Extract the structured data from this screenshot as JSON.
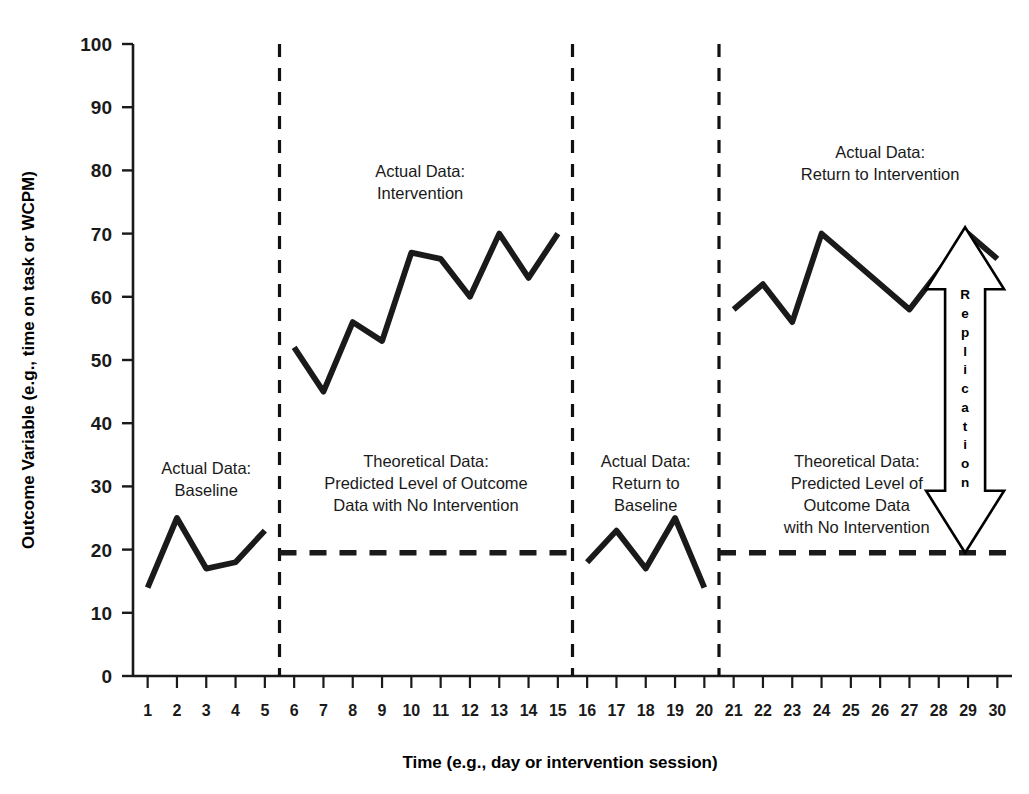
{
  "chart_data": {
    "type": "line",
    "title": "",
    "xlabel": "Time (e.g., day or intervention session)",
    "ylabel": "Outcome Variable (e.g., time on task or WCPM)",
    "xlim": [
      0.5,
      30.5
    ],
    "ylim": [
      0,
      100
    ],
    "yticks": [
      0,
      10,
      20,
      30,
      40,
      50,
      60,
      70,
      80,
      90,
      100
    ],
    "xticks": [
      1,
      2,
      3,
      4,
      5,
      6,
      7,
      8,
      9,
      10,
      11,
      12,
      13,
      14,
      15,
      16,
      17,
      18,
      19,
      20,
      21,
      22,
      23,
      24,
      25,
      26,
      27,
      28,
      29,
      30
    ],
    "grid": false,
    "legend": "none",
    "line_color": "#1a1a1a",
    "series": [
      {
        "name": "Baseline",
        "style": "solid",
        "x": [
          1,
          2,
          3,
          4,
          5
        ],
        "values": [
          14,
          25,
          17,
          18,
          23
        ]
      },
      {
        "name": "Intervention",
        "style": "solid",
        "x": [
          6,
          7,
          8,
          9,
          10,
          11,
          12,
          13,
          14,
          15
        ],
        "values": [
          52,
          45,
          56,
          53,
          67,
          66,
          60,
          70,
          63,
          70
        ]
      },
      {
        "name": "Return to Baseline",
        "style": "solid",
        "x": [
          16,
          17,
          18,
          19,
          20
        ],
        "values": [
          18,
          23,
          17,
          25,
          14
        ]
      },
      {
        "name": "Return to Intervention",
        "style": "solid",
        "x": [
          21,
          22,
          23,
          24,
          25,
          26,
          27,
          28,
          29,
          30
        ],
        "values": [
          58,
          62,
          56,
          70,
          66,
          62,
          58,
          64,
          70,
          66
        ]
      },
      {
        "name": "Theoretical Predicted Level 1",
        "style": "dashed",
        "x": [
          5.5,
          15.5
        ],
        "values": [
          19.5,
          19.5
        ]
      },
      {
        "name": "Theoretical Predicted Level 2",
        "style": "dashed",
        "x": [
          20.5,
          30.5
        ],
        "values": [
          19.5,
          19.5
        ]
      }
    ],
    "phase_lines": [
      {
        "x": 5.5,
        "style": "dashed"
      },
      {
        "x": 15.5,
        "style": "dashed"
      },
      {
        "x": 20.5,
        "style": "dashed"
      }
    ],
    "annotations": [
      {
        "name": "actual-data-baseline",
        "lines": [
          "Actual Data:",
          "Baseline"
        ],
        "x": 3.0,
        "y": 32
      },
      {
        "name": "actual-data-intervention",
        "lines": [
          "Actual Data:",
          "Intervention"
        ],
        "x": 10.3,
        "y": 79
      },
      {
        "name": "theoretical-data-1",
        "lines": [
          "Theoretical Data:",
          "Predicted Level of Outcome",
          "Data with No Intervention"
        ],
        "x": 10.5,
        "y": 33
      },
      {
        "name": "actual-data-return-to-baseline",
        "lines": [
          "Actual Data:",
          "Return to",
          "Baseline"
        ],
        "x": 18.0,
        "y": 33
      },
      {
        "name": "actual-data-return-to-intervention",
        "lines": [
          "Actual Data:",
          "Return to Intervention"
        ],
        "x": 26.0,
        "y": 82
      },
      {
        "name": "theoretical-data-2",
        "lines": [
          "Theoretical Data:",
          "Predicted Level of",
          "Outcome Data",
          "with No Intervention"
        ],
        "x": 25.2,
        "y": 33
      }
    ],
    "replication_arrow": {
      "label": "Replication",
      "letters": [
        "R",
        "e",
        "p",
        "l",
        "i",
        "c",
        "a",
        "t",
        "i",
        "o",
        "n"
      ],
      "x": 28.9,
      "y_top": 71,
      "y_bottom": 19.5,
      "style": "double-headed-outline"
    }
  }
}
